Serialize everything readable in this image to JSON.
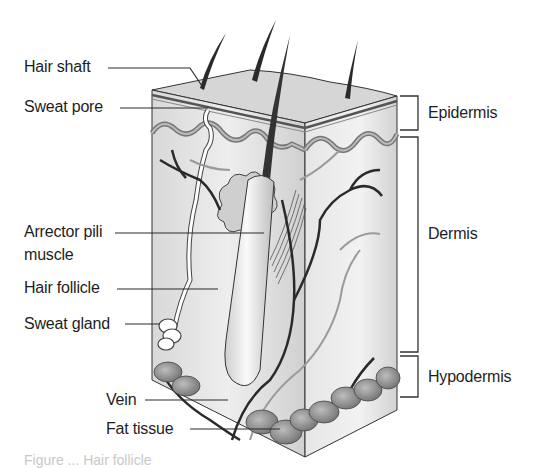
{
  "figure": {
    "caption": "Figure ... Hair follicle"
  },
  "left_labels": {
    "hair_shaft": "Hair shaft",
    "sweat_pore": "Sweat pore",
    "arrector_pili_line1": "Arrector pili",
    "arrector_pili_line2": "muscle",
    "hair_follicle": "Hair follicle",
    "sweat_gland": "Sweat gland",
    "vein": "Vein",
    "fat_tissue": "Fat tissue"
  },
  "layer_labels": {
    "epidermis": "Epidermis",
    "dermis": "Dermis",
    "hypodermis": "Hypodermis"
  },
  "colors": {
    "skin_top": "#d4d4d4",
    "skin_side": "#e2e2e2",
    "epidermis_band": "#8a8a8a",
    "vessels": "#2a2a2a",
    "nerves": "#9a9a9a",
    "fat": "#8c8c8c",
    "line": "#2b2b2b"
  }
}
